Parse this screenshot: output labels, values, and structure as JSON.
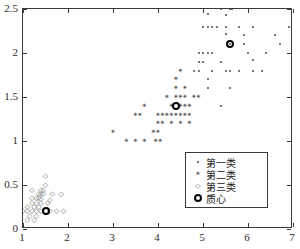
{
  "chart_data": {
    "type": "scatter",
    "title": "",
    "xlabel": "",
    "ylabel": "",
    "xlim": [
      1,
      7
    ],
    "ylim": [
      0,
      2.5
    ],
    "xticks": [
      "1",
      "2",
      "3",
      "4",
      "5",
      "6",
      "7"
    ],
    "yticks": [
      "0",
      "0.5",
      "1",
      "1.5",
      "2",
      "2.5"
    ],
    "grid": false,
    "legend_position": "lower right",
    "series": [
      {
        "name": "第一类",
        "marker": "dot",
        "color": "#4a4a4a",
        "points": [
          [
            5.4,
            2.5
          ],
          [
            5.6,
            2.5
          ],
          [
            5.65,
            2.5
          ],
          [
            5.1,
            2.44
          ],
          [
            5.5,
            2.43
          ],
          [
            5.0,
            2.3
          ],
          [
            5.1,
            2.3
          ],
          [
            5.2,
            2.3
          ],
          [
            5.3,
            2.3
          ],
          [
            5.5,
            2.3
          ],
          [
            5.8,
            2.3
          ],
          [
            6.1,
            2.3
          ],
          [
            6.9,
            2.3
          ],
          [
            5.5,
            2.22
          ],
          [
            5.9,
            2.21
          ],
          [
            6.6,
            2.2
          ],
          [
            5.6,
            2.1
          ],
          [
            5.9,
            2.1
          ],
          [
            6.7,
            2.1
          ],
          [
            4.9,
            2.0
          ],
          [
            5.0,
            2.0
          ],
          [
            5.1,
            2.0
          ],
          [
            5.2,
            2.0
          ],
          [
            6.0,
            2.0
          ],
          [
            6.4,
            2.0
          ],
          [
            4.9,
            1.9
          ],
          [
            5.0,
            1.9
          ],
          [
            5.4,
            1.9
          ],
          [
            6.1,
            1.92
          ],
          [
            4.8,
            1.8
          ],
          [
            4.9,
            1.8
          ],
          [
            5.2,
            1.8
          ],
          [
            5.5,
            1.8
          ],
          [
            5.6,
            1.8
          ],
          [
            5.8,
            1.8
          ],
          [
            6.1,
            1.8
          ],
          [
            6.3,
            1.8
          ],
          [
            5.1,
            1.7
          ],
          [
            5.1,
            1.6
          ],
          [
            5.6,
            1.6
          ],
          [
            5.4,
            1.4
          ]
        ]
      },
      {
        "name": "第二类",
        "marker": "star",
        "color": "#4a4a4a",
        "points": [
          [
            4.5,
            1.8
          ],
          [
            4.4,
            1.7
          ],
          [
            4.4,
            1.6
          ],
          [
            4.6,
            1.6
          ],
          [
            4.2,
            1.5
          ],
          [
            4.4,
            1.5
          ],
          [
            4.5,
            1.5
          ],
          [
            4.6,
            1.5
          ],
          [
            4.8,
            1.5
          ],
          [
            4.9,
            1.5
          ],
          [
            4.3,
            1.4
          ],
          [
            4.5,
            1.4
          ],
          [
            4.6,
            1.4
          ],
          [
            4.7,
            1.4
          ],
          [
            3.7,
            1.4
          ],
          [
            3.5,
            1.3
          ],
          [
            3.6,
            1.3
          ],
          [
            4.0,
            1.3
          ],
          [
            4.1,
            1.3
          ],
          [
            4.2,
            1.3
          ],
          [
            4.3,
            1.3
          ],
          [
            4.4,
            1.3
          ],
          [
            4.5,
            1.3
          ],
          [
            4.6,
            1.3
          ],
          [
            4.7,
            1.3
          ],
          [
            4.0,
            1.2
          ],
          [
            4.1,
            1.2
          ],
          [
            4.3,
            1.2
          ],
          [
            4.5,
            1.2
          ],
          [
            4.7,
            1.2
          ],
          [
            3.0,
            1.1
          ],
          [
            3.9,
            1.1
          ],
          [
            4.0,
            1.1
          ],
          [
            3.3,
            1.0
          ],
          [
            3.5,
            1.0
          ],
          [
            3.7,
            1.0
          ],
          [
            3.95,
            1.0
          ],
          [
            4.05,
            1.0
          ]
        ]
      },
      {
        "name": "第三类",
        "marker": "diamond",
        "color": "#6a6a6a",
        "points": [
          [
            1.5,
            0.6
          ],
          [
            1.5,
            0.5
          ],
          [
            1.2,
            0.44
          ],
          [
            1.4,
            0.44
          ],
          [
            1.45,
            0.44
          ],
          [
            1.35,
            0.4
          ],
          [
            1.4,
            0.4
          ],
          [
            1.45,
            0.4
          ],
          [
            1.65,
            0.4
          ],
          [
            1.85,
            0.4
          ],
          [
            1.2,
            0.35
          ],
          [
            1.3,
            0.35
          ],
          [
            1.35,
            0.35
          ],
          [
            1.4,
            0.34
          ],
          [
            1.6,
            0.33
          ],
          [
            1.2,
            0.3
          ],
          [
            1.3,
            0.3
          ],
          [
            1.4,
            0.3
          ],
          [
            1.55,
            0.3
          ],
          [
            1.1,
            0.25
          ],
          [
            1.25,
            0.25
          ],
          [
            1.35,
            0.25
          ],
          [
            1.0,
            0.2
          ],
          [
            1.1,
            0.2
          ],
          [
            1.2,
            0.2
          ],
          [
            1.3,
            0.2
          ],
          [
            1.4,
            0.2
          ],
          [
            1.6,
            0.2
          ],
          [
            1.75,
            0.2
          ],
          [
            1.9,
            0.2
          ],
          [
            1.15,
            0.15
          ],
          [
            1.3,
            0.15
          ],
          [
            1.1,
            0.1
          ],
          [
            1.25,
            0.1
          ]
        ]
      },
      {
        "name": "质心",
        "marker": "bold-circle",
        "color": "#000000",
        "points": [
          [
            5.6,
            2.1
          ],
          [
            4.4,
            1.4
          ],
          [
            1.5,
            0.2
          ]
        ]
      }
    ]
  },
  "legend": {
    "entries": [
      {
        "label": "第一类",
        "marker": "dot"
      },
      {
        "label": "第二类",
        "marker": "star"
      },
      {
        "label": "第三类",
        "marker": "diamond"
      },
      {
        "label": "质心",
        "marker": "bold-circle"
      }
    ]
  },
  "axes": {
    "x_tick_labels": [
      "1",
      "2",
      "3",
      "4",
      "5",
      "6",
      "7"
    ],
    "y_tick_labels": [
      "0",
      "0.5",
      "1",
      "1.5",
      "2",
      "2.5"
    ]
  }
}
